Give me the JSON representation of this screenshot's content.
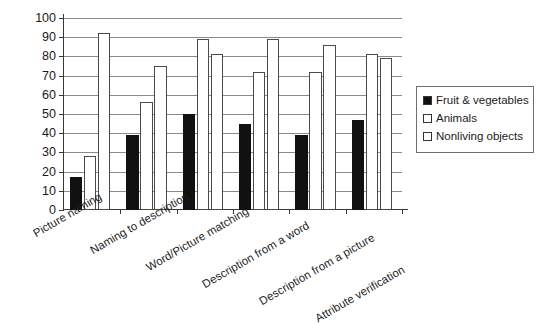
{
  "chart_data": {
    "type": "bar",
    "title": "",
    "xlabel": "",
    "ylabel": "% correct",
    "ylim": [
      0,
      100
    ],
    "ytick_step": 10,
    "yticks": [
      0,
      10,
      20,
      30,
      40,
      50,
      60,
      70,
      80,
      90,
      100
    ],
    "grid": true,
    "legend_position": "right",
    "categories": [
      "Picture naming",
      "Naming to description",
      "Word/Picture matching",
      "Description from a word",
      "Description from a picture",
      "Attribute verification"
    ],
    "series": [
      {
        "name": "Fruit & vegetables",
        "style": "filled",
        "color": "#111111",
        "values": [
          17,
          39,
          50,
          45,
          39,
          47
        ]
      },
      {
        "name": "Animals",
        "style": "hollow",
        "color": "#ffffff",
        "values": [
          28,
          56,
          89,
          72,
          72,
          81
        ]
      },
      {
        "name": "Nonliving objects",
        "style": "hollow",
        "color": "#ffffff",
        "values": [
          92,
          75,
          81,
          89,
          86,
          79
        ]
      }
    ]
  },
  "legend": {
    "items": [
      {
        "label": "Fruit & vegetables",
        "style": "filled"
      },
      {
        "label": "Animals",
        "style": "hollow"
      },
      {
        "label": "Nonliving objects",
        "style": "hollow"
      }
    ]
  }
}
